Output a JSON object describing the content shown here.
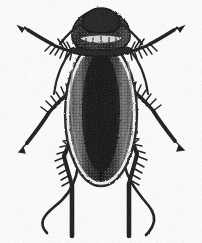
{
  "figure": {
    "kind": "scanned-line-illustration",
    "subject": "cockroach",
    "view": "dorsal",
    "alt_text": "Black and white engraved illustration of a cockroach seen from above, with two antennae, six spiny legs and dark wing covers.",
    "canvas": {
      "width": 202,
      "height": 243
    },
    "colors": {
      "background": "#ffffff",
      "ink": "#111111",
      "ink_soft": "#2b2b2b",
      "body_dark": "#1a1a1a",
      "body_mid": "#4a4a4a",
      "body_light": "#9b9b9b",
      "highlight": "#e8e8e8",
      "scan_noise": "#cfcfcf"
    }
  },
  "anatomy": {
    "head": {
      "label": "head",
      "center_x": 101,
      "center_y": 24,
      "width": 40,
      "height": 30
    },
    "pronotum": {
      "label": "pronotum",
      "center_x": 101,
      "center_y": 40,
      "width": 54,
      "height": 26,
      "marking": "pale transverse mottled band"
    },
    "tegmina": {
      "label": "wing covers",
      "center_x": 101,
      "center_y": 115,
      "width": 62,
      "height": 140
    },
    "abdomen_tip": {
      "label": "abdomen tip",
      "center_x": 101,
      "center_y": 178
    },
    "antennae": [
      {
        "label": "antenna-left",
        "side": "left",
        "style": "long wavy filament trailing down-left"
      },
      {
        "label": "antenna-right",
        "side": "right",
        "style": "long wavy filament trailing down-right"
      }
    ],
    "legs": [
      {
        "label": "foreleg-left",
        "pair": "fore",
        "side": "left",
        "direction": "up-left",
        "tip": "arrow",
        "spined": true
      },
      {
        "label": "foreleg-right",
        "pair": "fore",
        "side": "right",
        "direction": "up-right",
        "tip": "arrow",
        "spined": true
      },
      {
        "label": "midleg-left",
        "pair": "middle",
        "side": "left",
        "direction": "down-left",
        "tip": "arrow",
        "spined": true
      },
      {
        "label": "midleg-right",
        "pair": "middle",
        "side": "right",
        "direction": "down-right",
        "tip": "arrow",
        "spined": true
      },
      {
        "label": "hindleg-left",
        "pair": "hind",
        "side": "left",
        "direction": "down",
        "tip": "blunt",
        "spined": true
      },
      {
        "label": "hindleg-right",
        "pair": "hind",
        "side": "right",
        "direction": "down",
        "tip": "blunt",
        "spined": true
      }
    ]
  }
}
